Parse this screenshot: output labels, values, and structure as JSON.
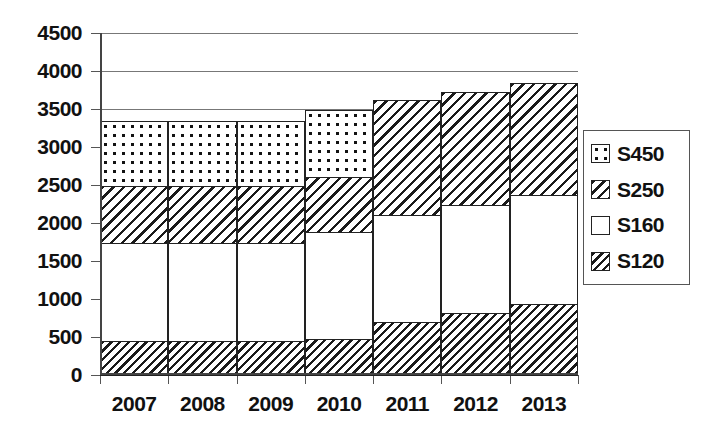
{
  "chart_data": {
    "type": "bar",
    "subtype": "stacked-bar",
    "title": "",
    "xlabel": "",
    "ylabel": "",
    "categories": [
      "2007",
      "2008",
      "2009",
      "2010",
      "2011",
      "2012",
      "2013"
    ],
    "series": [
      {
        "name": "S120",
        "pattern": "diagonal-hatch-dense",
        "values": [
          460,
          460,
          460,
          490,
          710,
          830,
          950
        ]
      },
      {
        "name": "S160",
        "pattern": "blank-white",
        "values": [
          1320,
          1320,
          1320,
          1430,
          1430,
          1440,
          1450
        ]
      },
      {
        "name": "S250",
        "pattern": "diagonal-hatch",
        "values": [
          760,
          760,
          760,
          740,
          1530,
          1510,
          1500
        ]
      },
      {
        "name": "S450",
        "pattern": "dotted-grid",
        "values": [
          880,
          880,
          880,
          900,
          0,
          0,
          0
        ]
      }
    ],
    "stack_order": [
      "S120",
      "S160",
      "S250",
      "S450"
    ],
    "totals": [
      3420,
      3420,
      3420,
      3560,
      3670,
      3780,
      3900
    ],
    "yticks": [
      0,
      500,
      1000,
      1500,
      2000,
      2500,
      3000,
      3500,
      4000,
      4500
    ],
    "ylim": [
      0,
      4500
    ],
    "gridlines_at": [
      3500,
      4000,
      4500
    ],
    "grid": true,
    "legend_position": "right",
    "legend_entries": [
      "S450",
      "S250",
      "S160",
      "S120"
    ]
  },
  "axis": {
    "yticklabels": [
      "4500",
      "4000",
      "3500",
      "3000",
      "2500",
      "2000",
      "1500",
      "1000",
      "500",
      "0"
    ],
    "xticklabels": [
      "2007",
      "2008",
      "2009",
      "2010",
      "2011",
      "2012",
      "2013"
    ]
  },
  "legend": {
    "items": [
      {
        "label": "S450"
      },
      {
        "label": "S250"
      },
      {
        "label": "S160"
      },
      {
        "label": "S120"
      }
    ]
  },
  "colors": {
    "ink": "#111111",
    "axis": "#444444",
    "gridline": "#777777",
    "fill": "#ffffff"
  }
}
